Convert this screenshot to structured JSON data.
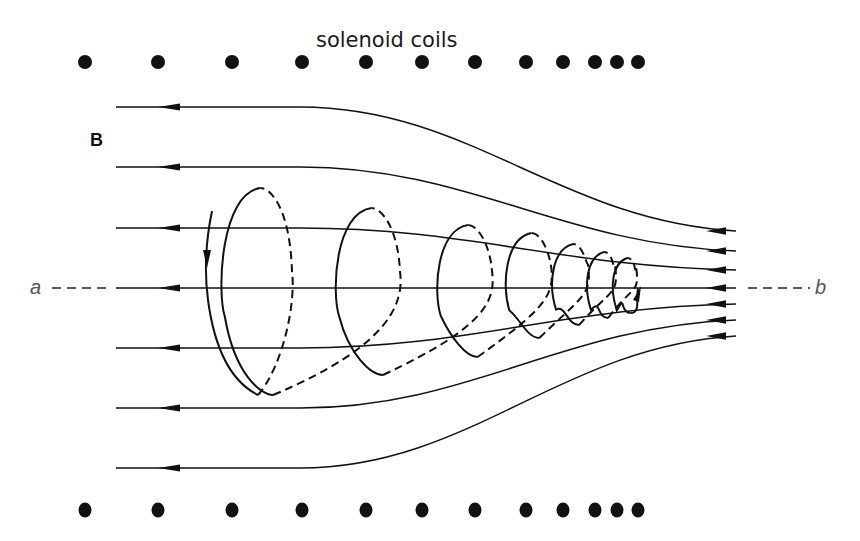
{
  "title": "solenoid coils",
  "field_label": "B",
  "axis": {
    "start_label": "a",
    "end_label": "b"
  },
  "colors": {
    "ink": "#111111",
    "background": "#ffffff",
    "label_gray": "#555555"
  },
  "coils": {
    "top_y": 62,
    "bottom_y": 510,
    "x_positions": [
      85,
      158,
      232,
      302,
      366,
      422,
      475,
      526,
      563,
      595,
      617,
      638
    ]
  },
  "field_lines": [
    {
      "left_y": 107,
      "right_y": 231
    },
    {
      "left_y": 167,
      "right_y": 251
    },
    {
      "left_y": 228,
      "right_y": 270
    },
    {
      "left_y": 288,
      "right_y": 288
    },
    {
      "left_y": 348,
      "right_y": 304
    },
    {
      "left_y": 408,
      "right_y": 320
    },
    {
      "left_y": 468,
      "right_y": 336
    }
  ],
  "spiral_loops": [
    {
      "cx": 250,
      "rx": 42,
      "top": 188,
      "bottom": 395
    },
    {
      "cx": 362,
      "rx": 38,
      "top": 208,
      "bottom": 375
    },
    {
      "cx": 460,
      "rx": 32,
      "top": 225,
      "bottom": 357
    },
    {
      "cx": 525,
      "rx": 26,
      "top": 233,
      "bottom": 338
    },
    {
      "cx": 568,
      "rx": 20,
      "top": 244,
      "bottom": 325
    },
    {
      "cx": 600,
      "rx": 15,
      "top": 252,
      "bottom": 318
    },
    {
      "cx": 624,
      "rx": 12,
      "top": 258,
      "bottom": 313
    }
  ]
}
